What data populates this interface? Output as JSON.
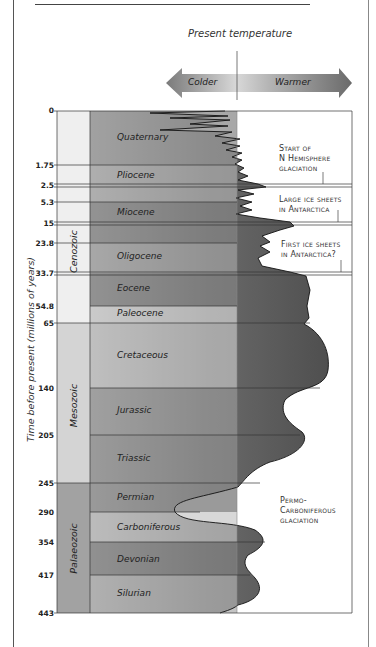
{
  "header": {
    "present_temperature_label": "Present temperature",
    "colder_label": "Colder",
    "warmer_label": "Warmer"
  },
  "axis": {
    "title": "Time before present (millions of years)",
    "ticks": [
      "0",
      "1.75",
      "2.5",
      "5.3",
      "15",
      "23.8",
      "33.7",
      "54.8",
      "65",
      "140",
      "205",
      "245",
      "290",
      "354",
      "417",
      "443"
    ]
  },
  "eras": [
    {
      "name": "Cenozoic"
    },
    {
      "name": "Mesozoic"
    },
    {
      "name": "Palaeozoic"
    }
  ],
  "periods": [
    {
      "name": "Quaternary"
    },
    {
      "name": "Pliocene"
    },
    {
      "name": "Miocene"
    },
    {
      "name": "Oligocene"
    },
    {
      "name": "Eocene"
    },
    {
      "name": "Paleocene"
    },
    {
      "name": "Cretaceous"
    },
    {
      "name": "Jurassic"
    },
    {
      "name": "Triassic"
    },
    {
      "name": "Permian"
    },
    {
      "name": "Carboniferous"
    },
    {
      "name": "Devonian"
    },
    {
      "name": "Silurian"
    }
  ],
  "annotations": [
    {
      "line1": "Start of",
      "line2": "N Hemisphere",
      "line3": "glaciation"
    },
    {
      "line1": "Large ice sheets",
      "line2": "in Antarctica"
    },
    {
      "line1": "First ice sheets",
      "line2": "in Antarctica?"
    },
    {
      "line1": "Permo-",
      "line2": "Carboniferous",
      "line3": "glaciation"
    }
  ],
  "colors": {
    "dark_band": "#8c8c8c",
    "mid_band": "#a9a9a9",
    "light_band": "#d6d6d6",
    "very_light_band": "#ececec",
    "curve_fill": "#6e6e6e"
  }
}
